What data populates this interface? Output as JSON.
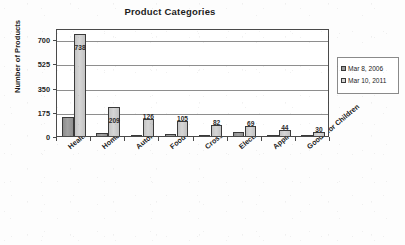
{
  "chart_data": {
    "type": "bar",
    "title": "Product Categories",
    "xlabel": "",
    "ylabel": "Number of Products",
    "ylim": [
      0,
      780
    ],
    "yticks": [
      0,
      175,
      350,
      525,
      700
    ],
    "grid": true,
    "legend_position": "right",
    "categories": [
      "Health and Fitness",
      "Home and Garden",
      "Automotive",
      "Food and Beverage",
      "Cross Cutting",
      "Electronics and Computers",
      "Applications",
      "Goods for Children"
    ],
    "series": [
      {
        "name": "Mar 8, 2006",
        "color": "#9a9a9a",
        "values": [
          135,
          25,
          10,
          18,
          10,
          28,
          8,
          3
        ],
        "labels_shown": false
      },
      {
        "name": "Mar 10, 2011",
        "color": "#d0d0d0",
        "values": [
          738,
          209,
          126,
          105,
          82,
          69,
          44,
          30
        ],
        "labels_shown": true,
        "labels": [
          "738",
          "209",
          "126",
          "105",
          "82",
          "69",
          "44",
          "30"
        ]
      }
    ]
  },
  "axis": {
    "y_tick_labels": [
      "700",
      "525",
      "350",
      "175",
      "0"
    ]
  },
  "legend": {
    "items": [
      {
        "label": "Mar 8, 2006"
      },
      {
        "label": "Mar 10, 2011"
      }
    ]
  }
}
